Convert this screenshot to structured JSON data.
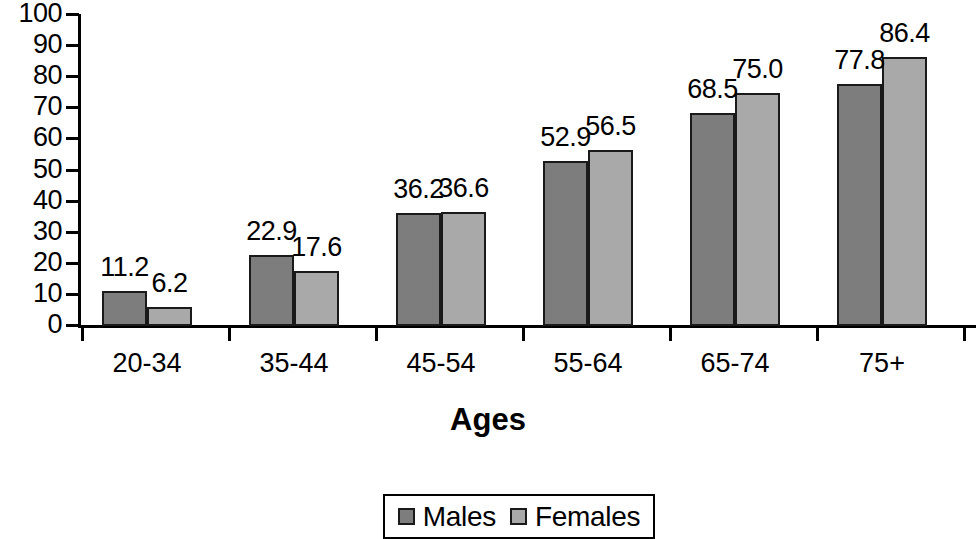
{
  "chart_data": {
    "type": "bar",
    "title": "",
    "xlabel": "Ages",
    "ylabel": "",
    "categories": [
      "20-34",
      "35-44",
      "45-54",
      "55-64",
      "65-74",
      "75+"
    ],
    "series": [
      {
        "name": "Males",
        "color": "#7d7d7d",
        "values": [
          11.2,
          22.9,
          36.2,
          52.9,
          68.5,
          77.8
        ],
        "value_labels": [
          "11.2",
          "22.9",
          "36.2",
          "52.9",
          "68.5",
          "77.8"
        ]
      },
      {
        "name": "Females",
        "color": "#a9a9a9",
        "values": [
          6.2,
          17.6,
          36.6,
          56.5,
          75.0,
          86.4
        ],
        "value_labels": [
          "6.2",
          "17.6",
          "36.6",
          "56.5",
          "75.0",
          "86.4"
        ]
      }
    ],
    "ylim": [
      0,
      100
    ],
    "ytick_labels": [
      "100",
      "90",
      "80",
      "70",
      "60",
      "50",
      "40",
      "30",
      "20",
      "10",
      "0"
    ],
    "ytick_values": [
      100,
      90,
      80,
      70,
      60,
      50,
      40,
      30,
      20,
      10,
      0
    ],
    "grid": false,
    "legend": {
      "position": "bottom",
      "entries": [
        {
          "label": "Males",
          "color": "#7d7d7d"
        },
        {
          "label": "Females",
          "color": "#a9a9a9"
        }
      ]
    }
  }
}
